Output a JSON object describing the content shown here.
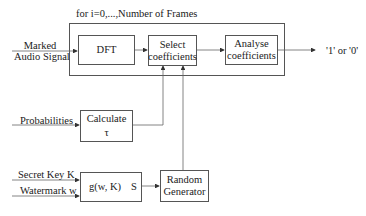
{
  "diagram": {
    "loop_title": "for i=0,...,Number of Frames",
    "inputs": {
      "marked_audio": [
        "Marked",
        "Audio Signal"
      ],
      "probabilities": "Probabilities",
      "secret_key": "Secret Key K",
      "watermark": "Watermark w"
    },
    "blocks": {
      "dft": "DFT",
      "select": [
        "Select",
        "coefficients"
      ],
      "analyse": [
        "Analyse",
        "coefficients"
      ],
      "calculate": [
        "Calculate",
        "τ"
      ],
      "g_function": [
        "g(w, K)",
        "S"
      ],
      "random": [
        "Random",
        "Generator"
      ]
    },
    "output": "'1' or '0'"
  }
}
